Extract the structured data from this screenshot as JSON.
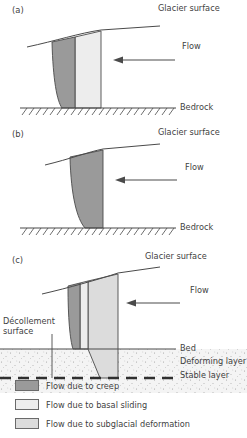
{
  "figure": {
    "title_panels": [
      "(a)",
      "(b)",
      "(c)"
    ],
    "colors": {
      "creep": "#9a9a9a",
      "basal_sliding": "#ededed",
      "subglacial_deformation": "#dcdcdc",
      "line": "#4a4a4a",
      "text": "#3f3f3f",
      "sediment": "#f2f2f2"
    }
  },
  "panels": [
    {
      "tag": "(a)",
      "labels": {
        "glacier_surface": "Glacier surface",
        "flow": "Flow",
        "bedrock": "Bedrock"
      }
    },
    {
      "tag": "(b)",
      "labels": {
        "glacier_surface": "Glacier surface",
        "flow": "Flow",
        "bedrock": "Bedrock"
      }
    },
    {
      "tag": "(c)",
      "labels": {
        "glacier_surface": "Glacier surface",
        "flow": "Flow",
        "decollement_line1": "Décollement",
        "decollement_line2": "surface",
        "bed": "Bed",
        "deforming_layer": "Deforming layer",
        "stable_layer": "Stable layer"
      }
    }
  ],
  "legend": {
    "items": [
      {
        "label": "Flow due to creep",
        "color": "#9a9a9a"
      },
      {
        "label": "Flow due to basal sliding",
        "color": "#ededed"
      },
      {
        "label": "Flow due to subglacial deformation",
        "color": "#dcdcdc"
      }
    ]
  }
}
